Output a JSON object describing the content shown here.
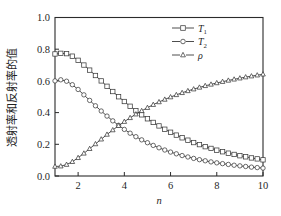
{
  "chart_data": {
    "type": "line",
    "title": "",
    "xlabel": "n",
    "ylabel": "透射率和反射率的值",
    "xlim": [
      1,
      10
    ],
    "ylim": [
      0.0,
      1.0
    ],
    "xticks": [
      2,
      4,
      6,
      8,
      10
    ],
    "xtick_labels": [
      "2",
      "4",
      "6",
      "8",
      "10"
    ],
    "yticks": [
      0.0,
      0.2,
      0.4,
      0.6,
      0.8,
      1.0
    ],
    "ytick_labels": [
      "0.0",
      "0.2",
      "0.4",
      "0.6",
      "0.8",
      "1.0"
    ],
    "grid": false,
    "legend_position": "top-right",
    "x": [
      1.0,
      1.25,
      1.5,
      1.75,
      2.0,
      2.25,
      2.5,
      2.75,
      3.0,
      3.25,
      3.5,
      3.75,
      4.0,
      4.25,
      4.5,
      4.75,
      5.0,
      5.25,
      5.5,
      5.75,
      6.0,
      6.25,
      6.5,
      6.75,
      7.0,
      7.25,
      7.5,
      7.75,
      8.0,
      8.25,
      8.5,
      8.75,
      9.0,
      9.25,
      9.5,
      9.75,
      10.0
    ],
    "series": [
      {
        "name": "T1",
        "label": "T",
        "subscript": "1",
        "marker": "square",
        "values": [
          0.77,
          0.774,
          0.772,
          0.756,
          0.73,
          0.7,
          0.668,
          0.634,
          0.6,
          0.566,
          0.533,
          0.5,
          0.47,
          0.44,
          0.412,
          0.386,
          0.361,
          0.338,
          0.316,
          0.295,
          0.276,
          0.258,
          0.241,
          0.226,
          0.211,
          0.198,
          0.185,
          0.174,
          0.163,
          0.153,
          0.144,
          0.136,
          0.128,
          0.121,
          0.114,
          0.108,
          0.102
        ]
      },
      {
        "name": "T2",
        "label": "T",
        "subscript": "2",
        "marker": "circle",
        "values": [
          0.6,
          0.607,
          0.598,
          0.576,
          0.546,
          0.512,
          0.477,
          0.443,
          0.41,
          0.378,
          0.348,
          0.32,
          0.294,
          0.27,
          0.248,
          0.228,
          0.21,
          0.193,
          0.178,
          0.164,
          0.151,
          0.14,
          0.129,
          0.12,
          0.111,
          0.103,
          0.096,
          0.089,
          0.083,
          0.078,
          0.073,
          0.068,
          0.064,
          0.06,
          0.056,
          0.053,
          0.05
        ]
      },
      {
        "name": "rho",
        "label": "ρ",
        "subscript": "",
        "marker": "triangle",
        "values": [
          0.06,
          0.062,
          0.072,
          0.09,
          0.115,
          0.143,
          0.172,
          0.202,
          0.232,
          0.262,
          0.29,
          0.317,
          0.343,
          0.367,
          0.39,
          0.411,
          0.431,
          0.45,
          0.467,
          0.483,
          0.498,
          0.512,
          0.525,
          0.537,
          0.548,
          0.559,
          0.569,
          0.578,
          0.587,
          0.595,
          0.603,
          0.61,
          0.617,
          0.624,
          0.63,
          0.636,
          0.642
        ]
      }
    ]
  },
  "legend": {
    "entries": [
      {
        "label": "T",
        "subscript": "1",
        "marker": "square"
      },
      {
        "label": "T",
        "subscript": "2",
        "marker": "circle"
      },
      {
        "label": "ρ",
        "subscript": "",
        "marker": "triangle"
      }
    ]
  },
  "axes": {
    "x_title": "n",
    "y_title": "透射率和反射率的值"
  }
}
